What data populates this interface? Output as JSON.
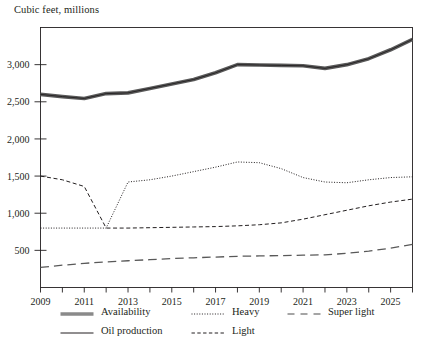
{
  "chart_data": {
    "type": "line",
    "title": "Cubic feet, millions",
    "xlabel": "",
    "ylabel": "Cubic feet, millions",
    "grid": false,
    "legend_position": "bottom",
    "xlim": [
      2009,
      2026
    ],
    "ylim": [
      0,
      3500
    ],
    "ytick_values": [
      500,
      1000,
      1500,
      2000,
      2500,
      3000
    ],
    "ytick_labels": [
      "500",
      "1,000",
      "1,500",
      "2,000",
      "2,500",
      "3,000"
    ],
    "xtick_values": [
      2009,
      2010,
      2011,
      2012,
      2013,
      2014,
      2015,
      2016,
      2017,
      2018,
      2019,
      2020,
      2021,
      2022,
      2023,
      2024,
      2025,
      2026
    ],
    "xtick_labels_shown": [
      "2009",
      "2011",
      "2013",
      "2015",
      "2017",
      "2019",
      "2021",
      "2023",
      "2025"
    ],
    "x": [
      2009,
      2010,
      2011,
      2012,
      2013,
      2014,
      2015,
      2016,
      2017,
      2018,
      2019,
      2020,
      2021,
      2022,
      2023,
      2024,
      2025,
      2026
    ],
    "series": [
      {
        "name": "Availability",
        "style": "thick-solid",
        "color": "#595959",
        "values": [
          2600,
          2570,
          2545,
          2610,
          2620,
          2680,
          2740,
          2800,
          2890,
          3000,
          2995,
          2990,
          2985,
          2950,
          3000,
          3080,
          3200,
          3340
        ]
      },
      {
        "name": "Oil production",
        "style": "thin-solid",
        "color": "#231f20",
        "values": [
          2600,
          2570,
          2545,
          2610,
          2620,
          2680,
          2740,
          2800,
          2890,
          3000,
          2995,
          2990,
          2985,
          2950,
          3000,
          3080,
          3200,
          3340
        ]
      },
      {
        "name": "Heavy",
        "style": "dotted",
        "color": "#231f20",
        "values": [
          800,
          800,
          800,
          800,
          1420,
          1450,
          1500,
          1560,
          1620,
          1690,
          1680,
          1600,
          1480,
          1420,
          1410,
          1450,
          1480,
          1490
        ]
      },
      {
        "name": "Light",
        "style": "dashed",
        "color": "#231f20",
        "values": [
          1500,
          1450,
          1360,
          800,
          800,
          805,
          810,
          815,
          820,
          830,
          845,
          870,
          920,
          980,
          1040,
          1100,
          1150,
          1190
        ]
      },
      {
        "name": "Super light",
        "style": "long-dash",
        "color": "#595959",
        "values": [
          270,
          300,
          325,
          345,
          360,
          375,
          390,
          400,
          410,
          420,
          425,
          430,
          435,
          440,
          460,
          490,
          530,
          580
        ]
      }
    ]
  },
  "legend": {
    "items": [
      {
        "label": "Availability",
        "style": "thick-solid"
      },
      {
        "label": "Heavy",
        "style": "dotted"
      },
      {
        "label": "Super light",
        "style": "long-dash"
      },
      {
        "label": "Oil production",
        "style": "thin-solid"
      },
      {
        "label": "Light",
        "style": "dashed"
      }
    ]
  }
}
